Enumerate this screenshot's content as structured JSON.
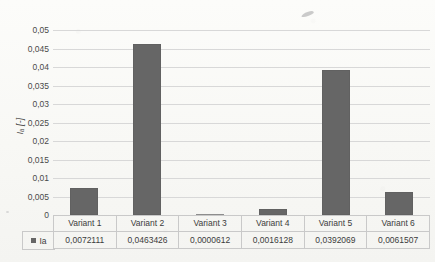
{
  "chart_data": {
    "type": "bar",
    "title": "",
    "xlabel": "",
    "ylabel": "I_a [-]",
    "ylabel_display": "Iₐ [-]",
    "ylim": [
      0,
      0.05
    ],
    "ytick_labels": [
      "0,05",
      "0,045",
      "0,04",
      "0,035",
      "0,03",
      "0,025",
      "0,02",
      "0,015",
      "0,01",
      "0,005",
      "0"
    ],
    "ytick_values": [
      0.05,
      0.045,
      0.04,
      0.035,
      0.03,
      0.025,
      0.02,
      0.015,
      0.01,
      0.005,
      0
    ],
    "grid": true,
    "legend_position": "data-table",
    "categories": [
      "Variant 1",
      "Variant 2",
      "Variant 3",
      "Variant 4",
      "Variant 5",
      "Variant 6"
    ],
    "series": [
      {
        "name": "Ia",
        "color": "#666666",
        "values": [
          0.0072111,
          0.0463426,
          6.12e-05,
          0.0016128,
          0.0392069,
          0.0061507
        ],
        "value_labels": [
          "0,0072111",
          "0,0463426",
          "0,0000612",
          "0,0016128",
          "0,0392069",
          "0,0061507"
        ]
      }
    ]
  },
  "data_table": {
    "legend_series_label": "Ia",
    "legend_marker": "square-swatch",
    "header_row": [
      "Variant 1",
      "Variant 2",
      "Variant 3",
      "Variant 4",
      "Variant 5",
      "Variant 6"
    ],
    "values_row": [
      "0,0072111",
      "0,0463426",
      "0,0000612",
      "0,0016128",
      "0,0392069",
      "0,0061507"
    ]
  },
  "colors": {
    "bar": "#666666",
    "gridline": "#d8d8d8",
    "axis": "#c2c2c2",
    "table_border": "#c9c9c9",
    "background": "#fbfbf9",
    "text": "#3c3c3c"
  }
}
